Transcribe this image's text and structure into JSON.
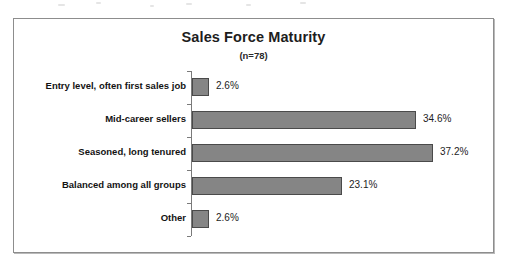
{
  "chart_data": {
    "type": "bar",
    "orientation": "horizontal",
    "title": "Sales Force Maturity",
    "subtitle": "(n=78)",
    "sample_size": "n=78",
    "xlabel": "",
    "ylabel": "",
    "grid": false,
    "legend": false,
    "xlim": [
      0,
      40
    ],
    "categories": [
      "Entry level, often first sales job",
      "Mid-career sellers",
      "Seasoned, long tenured",
      "Balanced among all groups",
      "Other"
    ],
    "values": [
      2.6,
      34.6,
      37.2,
      23.1,
      2.6
    ],
    "value_labels": [
      "2.6%",
      "34.6%",
      "37.2%",
      "23.1%",
      "2.6%"
    ],
    "units": "percent",
    "bar_color": "#858585",
    "bar_border_color": "#4a4a4a",
    "axis_color": "#7a7a7a",
    "frame_border_color": "#8d8d8d",
    "text_color": "#131313",
    "background": "#ffffff"
  }
}
